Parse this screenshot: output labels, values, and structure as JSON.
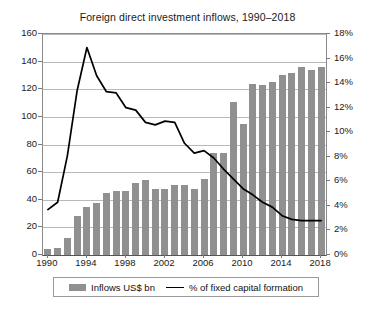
{
  "chart_data": {
    "type": "bar",
    "title": "Foreign direct investment inflows, 1990–2018",
    "xlabel": "",
    "ylabel": "",
    "grid": true,
    "legend_position": "bottom",
    "categories": [
      1990,
      1991,
      1992,
      1993,
      1994,
      1995,
      1996,
      1997,
      1998,
      1999,
      2000,
      2001,
      2002,
      2003,
      2004,
      2005,
      2006,
      2007,
      2008,
      2009,
      2010,
      2011,
      2012,
      2013,
      2014,
      2015,
      2016,
      2017,
      2018
    ],
    "xtick_labels": [
      "1990",
      "1994",
      "1998",
      "2002",
      "2006",
      "2010",
      "2014",
      "2018"
    ],
    "axes": {
      "left": {
        "label": "Inflows US$ bn",
        "ylim": [
          0,
          160
        ],
        "ticks": [
          0,
          20,
          40,
          60,
          80,
          100,
          120,
          140,
          160
        ],
        "tick_labels": [
          "0",
          "20",
          "40",
          "60",
          "80",
          "100",
          "120",
          "140",
          "160"
        ]
      },
      "right": {
        "label": "% of fixed capital formation",
        "ylim": [
          0,
          18
        ],
        "ticks": [
          0,
          2,
          4,
          6,
          8,
          10,
          12,
          14,
          16,
          18
        ],
        "tick_labels": [
          "0%",
          "2%",
          "4%",
          "6%",
          "8%",
          "10%",
          "12%",
          "14%",
          "16%",
          "18%"
        ]
      }
    },
    "series": [
      {
        "name": "Inflows US$ bn",
        "type": "bar",
        "axis": "left",
        "color": "#909090",
        "values": [
          4,
          5,
          12,
          28,
          35,
          38,
          45,
          46,
          46,
          52,
          54,
          48,
          48,
          51,
          51,
          48,
          55,
          74,
          74,
          111,
          95,
          124,
          123,
          125,
          130,
          132,
          136,
          134,
          136
        ]
      },
      {
        "name": "% of fixed capital formation",
        "type": "line",
        "axis": "right",
        "color": "#000000",
        "values": [
          3.7,
          4.3,
          8.1,
          13.4,
          16.9,
          14.6,
          13.3,
          13.2,
          12.0,
          11.8,
          10.8,
          10.6,
          10.9,
          10.8,
          9.1,
          8.3,
          8.5,
          7.9,
          7.0,
          6.2,
          5.4,
          4.9,
          4.3,
          3.9,
          3.2,
          2.9,
          2.8,
          2.8,
          2.8
        ]
      }
    ],
    "colors": {
      "bar": "#909090",
      "line": "#000000",
      "gridline": "#b9b9b9",
      "axis": "#8a8a8a",
      "text": "#1a1a1a",
      "background": "#ffffff"
    }
  },
  "legend": {
    "items": [
      {
        "label": "Inflows US$ bn",
        "marker": "bar-swatch",
        "color": "#909090"
      },
      {
        "label": "% of fixed capital formation",
        "marker": "line-swatch",
        "color": "#000000"
      }
    ]
  }
}
